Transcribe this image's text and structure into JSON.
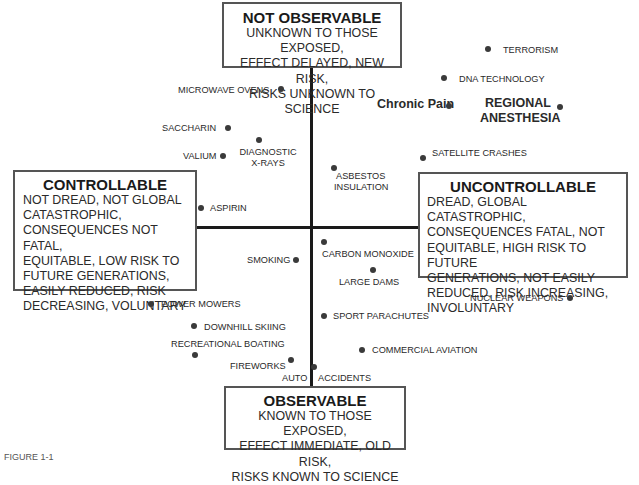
{
  "boxes": {
    "top": {
      "title": "NOT OBSERVABLE",
      "lines": [
        "UNKNOWN TO THOSE EXPOSED,",
        "EFFECT DELAYED, NEW RISK,",
        "RISKS UNKNOWN TO SCIENCE"
      ]
    },
    "bottom": {
      "title": "OBSERVABLE",
      "lines": [
        "KNOWN TO THOSE EXPOSED,",
        "EFFECT IMMEDIATE, OLD RISK,",
        "RISKS KNOWN TO SCIENCE"
      ]
    },
    "left": {
      "title": "CONTROLLABLE",
      "lines": [
        "NOT DREAD, NOT GLOBAL",
        "CATASTROPHIC,",
        "CONSEQUENCES NOT FATAL,",
        "EQUITABLE, LOW RISK TO",
        "FUTURE GENERATIONS,",
        "EASILY REDUCED, RISK",
        "DECREASING, VOLUNTARY"
      ]
    },
    "right": {
      "title": "UNCONTROLLABLE",
      "lines": [
        "DREAD, GLOBAL CATASTROPHIC,",
        "CONSEQUENCES FATAL,  NOT",
        "EQUITABLE, HIGH RISK TO FUTURE",
        "GENERATIONS, NOT EASILY",
        "REDUCED, RISK INCREASING,",
        "INVOLUNTARY"
      ]
    }
  },
  "risks": [
    {
      "name": "TERRORISM"
    },
    {
      "name": "DNA TECHNOLOGY"
    },
    {
      "name": "Chronic Pain"
    },
    {
      "name": "REGIONAL",
      "name2": "ANESTHESIA"
    },
    {
      "name": "MICROWAVE OVENS"
    },
    {
      "name": "SACCHARIN"
    },
    {
      "name": "DIAGNOSTIC",
      "name2": "X-RAYS"
    },
    {
      "name": "VALIUM"
    },
    {
      "name": "SATELLITE CRASHES"
    },
    {
      "name": "ASBESTOS",
      "name2": "INSULATION"
    },
    {
      "name": "ASPIRIN"
    },
    {
      "name": "CARBON MONOXIDE"
    },
    {
      "name": "SMOKING"
    },
    {
      "name": "LARGE  DAMS"
    },
    {
      "name": "NUCLEAR WEAPONS"
    },
    {
      "name": "POWER MOWERS"
    },
    {
      "name": "SPORT PARACHUTES"
    },
    {
      "name": "DOWNHILL SKIING"
    },
    {
      "name": "RECREATIONAL BOATING"
    },
    {
      "name": "COMMERCIAL AVIATION"
    },
    {
      "name": "FIREWORKS"
    },
    {
      "name": "AUTO"
    },
    {
      "name": "ACCIDENTS"
    }
  ],
  "caption": "FIGURE 1-1"
}
